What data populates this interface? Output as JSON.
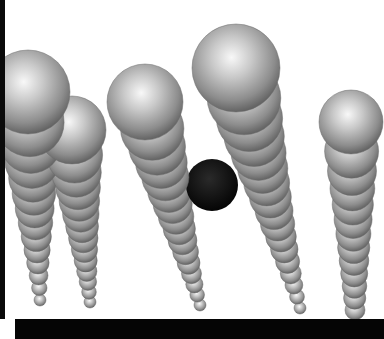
{
  "image": {
    "description": "3D render of rows of glossy grey spheres fanning out in perspective, one black sphere among them",
    "width": 384,
    "height": 339,
    "colors": {
      "background": "#ffffff",
      "sphere_light": "#f4f4f4",
      "sphere_mid": "#a8a8a8",
      "sphere_dark": "#5a5a5a",
      "accent_sphere": "#050505",
      "frame_bars": "#0a0a0a"
    },
    "rows": [
      {
        "name": "row-1",
        "head": {
          "x": 28,
          "y": 92,
          "r": 42
        },
        "tail": {
          "x": 40,
          "y": 300,
          "r": 6
        },
        "count": 14
      },
      {
        "name": "row-2",
        "head": {
          "x": 72,
          "y": 130,
          "r": 34
        },
        "tail": {
          "x": 90,
          "y": 302,
          "r": 6
        },
        "count": 14
      },
      {
        "name": "row-3",
        "head": {
          "x": 145,
          "y": 102,
          "r": 38
        },
        "tail": {
          "x": 200,
          "y": 305,
          "r": 6
        },
        "count": 16
      },
      {
        "name": "row-4",
        "head": {
          "x": 236,
          "y": 68,
          "r": 44
        },
        "tail": {
          "x": 300,
          "y": 308,
          "r": 6
        },
        "count": 17
      },
      {
        "name": "row-5",
        "head": {
          "x": 351,
          "y": 122,
          "r": 32
        },
        "tail": {
          "x": 355,
          "y": 310,
          "r": 10
        },
        "count": 13
      }
    ],
    "accent_sphere": {
      "x": 212,
      "y": 185,
      "r": 26
    }
  }
}
